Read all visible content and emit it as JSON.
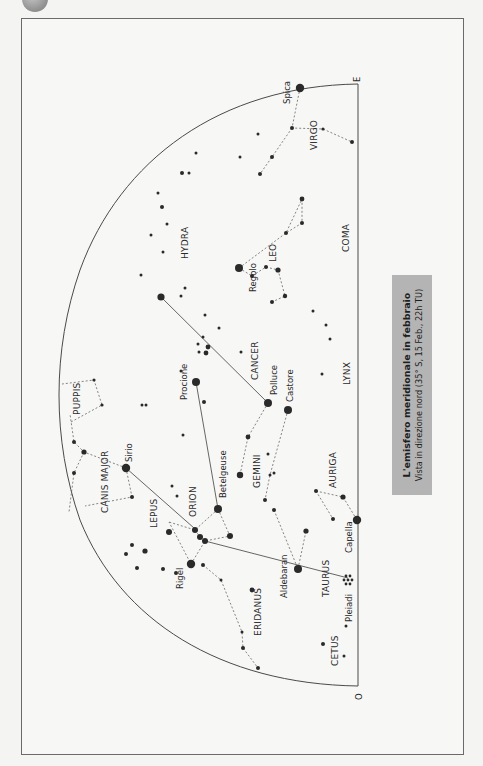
{
  "caption": {
    "title": "L'emisfero meridionale in febbraio",
    "subtitle": "Vista in direzione nord (35° S, 15 Feb., 22h TU)"
  },
  "directions": {
    "east": "E",
    "west": "O"
  },
  "constellations": [
    "VIRGO",
    "COMA",
    "LEO",
    "HYDRA",
    "CANCER",
    "LYNX",
    "PUPPIS",
    "CANIS MAJOR",
    "GEMINI",
    "AURIGA",
    "LEPUS",
    "ORION",
    "TAURUS",
    "ERIDANUS",
    "CETUS"
  ],
  "stars": [
    "Spica",
    "Regolo",
    "Polluce",
    "Castore",
    "Procione",
    "Sirio",
    "Betelgeuse",
    "Capella",
    "Aldebaran",
    "Rigel",
    "Pleiadi"
  ],
  "colors": {
    "background": "#f4f4f3",
    "line": "#4a4a4a",
    "star": "#2a2a2a",
    "caption_bg": "#b4b4b4"
  }
}
